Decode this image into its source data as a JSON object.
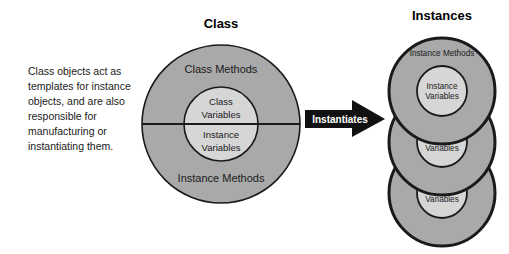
{
  "canvas": {
    "width": 509,
    "height": 254,
    "background": "#ffffff"
  },
  "colors": {
    "outer_circle_fill": "#a9a9a9",
    "inner_circle_fill": "#d6d6d6",
    "stroke": "#1a1a1a",
    "arrow_fill": "#111111",
    "arrow_text": "#ffffff",
    "text": "#1a1a1a"
  },
  "description": {
    "name": "class-description",
    "lines": [
      "Class objects act as",
      "templates for instance",
      "objects, and are also",
      "responsible for",
      "manufacturing or",
      "instantiating them."
    ]
  },
  "class_diagram": {
    "title": "Class",
    "outer_top_label": "Class Methods",
    "outer_bottom_label": "Instance Methods",
    "inner_top_label": "Class",
    "inner_top_label2": "Variables",
    "inner_bottom_label": "Instance",
    "inner_bottom_label2": "Variables",
    "divider": "horizontal-split-line"
  },
  "arrow": {
    "label": "Instantiates",
    "direction": "right"
  },
  "instances_diagram": {
    "title": "Instances",
    "instances": [
      {
        "outer_label": "Instance Methods",
        "inner_label_line1": "Instance",
        "inner_label_line2": "Variables",
        "occluded": false
      },
      {
        "outer_label": "Instance Methods",
        "inner_label_line1": "Instance",
        "inner_label_line2": "Variables",
        "occluded": true
      },
      {
        "outer_label": "Instance Methods",
        "inner_label_line1": "Instance",
        "inner_label_line2": "Variables",
        "occluded": true
      }
    ]
  }
}
